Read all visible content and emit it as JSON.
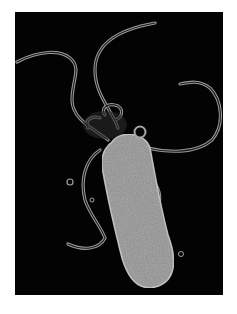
{
  "image": {
    "subject": "rod-shaped bacterium with multiple flagella",
    "background_color": "#030303",
    "body_color": "#8f8f8f",
    "flagella_color": "#a0a0a0",
    "frame_color": "#ffffff"
  }
}
